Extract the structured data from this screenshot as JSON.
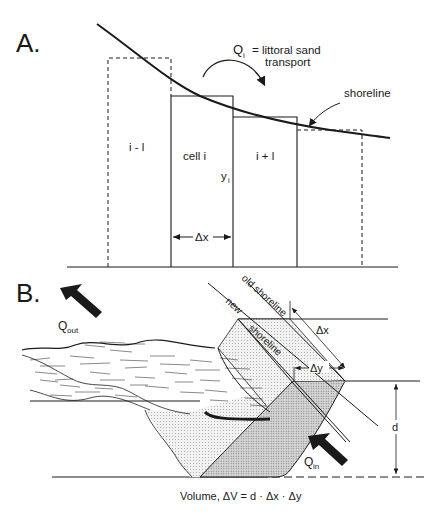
{
  "figure": {
    "panel_a": {
      "label": "A.",
      "annotation_q": "Q",
      "annotation_q_sub": "i",
      "annotation_text_1": "= littoral sand",
      "annotation_text_2": "transport",
      "shoreline_label": "shoreline",
      "cells": [
        {
          "label": "i - l",
          "style": "dashed"
        },
        {
          "label": "cell i",
          "style": "solid"
        },
        {
          "label": "i + l",
          "style": "solid"
        },
        {
          "label": "",
          "style": "dashed"
        }
      ],
      "y_label": "y",
      "y_label_sub": "i",
      "dx_label": "Δx"
    },
    "panel_b": {
      "label": "B.",
      "q_out": "Q",
      "q_out_sub": "out",
      "q_in": "Q",
      "q_in_sub": "in",
      "old_shoreline": "old shoreline",
      "new_label": "new",
      "shoreline_label": "shoreline",
      "dx_label": "Δx",
      "dy_label": "Δy",
      "d_label": "d",
      "volume_formula": "Volume,  ΔV = d · Δx · Δy"
    },
    "colors": {
      "ink": "#1a1a1a",
      "shade_light": "#ececec",
      "shade_dark": "#cfcfcf"
    }
  }
}
